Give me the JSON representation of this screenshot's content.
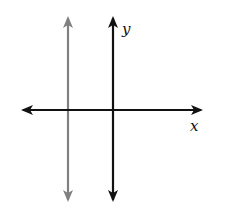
{
  "diagram": {
    "type": "coordinate-axes-with-vertical-line",
    "axes": {
      "x_label": "x",
      "y_label": "y",
      "color": "#111111"
    },
    "vertical_line": {
      "description": "vertical line left of y-axis (x = negative constant)",
      "color": "#808080"
    }
  }
}
